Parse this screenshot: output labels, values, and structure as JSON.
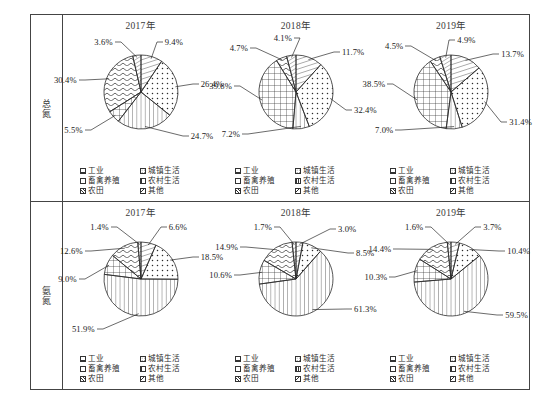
{
  "row_labels": [
    "总氮",
    "氨氮"
  ],
  "years": [
    "2017年",
    "2018年",
    "2019年"
  ],
  "legend": [
    {
      "key": "industry",
      "label": "工业",
      "pattern": "wave"
    },
    {
      "key": "urban",
      "label": "城镇生活",
      "pattern": "dots"
    },
    {
      "key": "livestock",
      "label": "畜禽养殖",
      "pattern": "grid"
    },
    {
      "key": "rural",
      "label": "农村生活",
      "pattern": "vert"
    },
    {
      "key": "farmland",
      "label": "农田",
      "pattern": "diag"
    },
    {
      "key": "other",
      "label": "其他",
      "pattern": "diagsmall"
    }
  ],
  "chart_data": [
    {
      "type": "pie",
      "title": "2017年",
      "group": "总氮",
      "labels": [
        "农田",
        "城镇生活",
        "农村生活",
        "畜禽养殖",
        "工业",
        "其他"
      ],
      "values": [
        9.4,
        26.4,
        24.7,
        5.5,
        30.4,
        3.6
      ],
      "value_labels": [
        "9.4%",
        "26.4%",
        "24.7%",
        "5.5%",
        "30.4%",
        "3.6%"
      ]
    },
    {
      "type": "pie",
      "title": "2018年",
      "group": "总氮",
      "labels": [
        "农田",
        "城镇生活",
        "农村生活",
        "畜禽养殖",
        "工业",
        "其他"
      ],
      "values": [
        11.7,
        32.4,
        7.2,
        39.8,
        4.7,
        4.1
      ],
      "value_labels": [
        "11.7%",
        "32.4%",
        "7.2%",
        "39.8%",
        "4.7%",
        "4.1%"
      ]
    },
    {
      "type": "pie",
      "title": "2019年",
      "group": "总氮",
      "labels": [
        "农田",
        "城镇生活",
        "农村生活",
        "畜禽养殖",
        "工业",
        "其他"
      ],
      "values": [
        13.7,
        31.4,
        7.0,
        38.5,
        4.5,
        4.9
      ],
      "value_labels": [
        "13.7%",
        "31.4%",
        "7.0%",
        "38.5%",
        "4.5%",
        "4.9%"
      ]
    },
    {
      "type": "pie",
      "title": "2017年",
      "group": "氨氮",
      "labels": [
        "农田",
        "城镇生活",
        "农村生活",
        "畜禽养殖",
        "工业",
        "其他"
      ],
      "values": [
        6.6,
        18.5,
        51.9,
        9.0,
        12.6,
        1.4
      ],
      "value_labels": [
        "6.6%",
        "18.5%",
        "51.9%",
        "9.0%",
        "12.6%",
        "1.4%"
      ]
    },
    {
      "type": "pie",
      "title": "2018年",
      "group": "氨氮",
      "labels": [
        "农田",
        "城镇生活",
        "农村生活",
        "畜禽养殖",
        "工业",
        "其他"
      ],
      "values": [
        3.0,
        8.5,
        61.3,
        10.6,
        14.9,
        1.7
      ],
      "value_labels": [
        "3.0%",
        "8.5%",
        "61.3%",
        "10.6%",
        "14.9%",
        "1.7%"
      ]
    },
    {
      "type": "pie",
      "title": "2019年",
      "group": "氨氮",
      "labels": [
        "农田",
        "城镇生活",
        "农村生活",
        "畜禽养殖",
        "工业",
        "其他"
      ],
      "values": [
        3.7,
        10.4,
        59.5,
        10.3,
        14.4,
        1.6
      ],
      "value_labels": [
        "3.7%",
        "10.4%",
        "59.5%",
        "10.3%",
        "14.4%",
        "1.6%"
      ]
    }
  ]
}
